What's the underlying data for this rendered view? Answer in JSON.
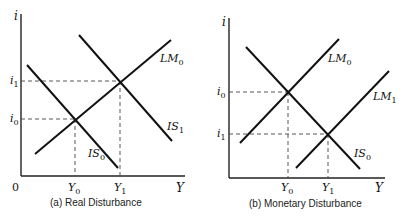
{
  "figure": {
    "panels": [
      {
        "id": "a",
        "caption": "(a) Real Disturbance",
        "y_axis_label": "i",
        "x_axis_label": "Y",
        "origin_label": "0",
        "curves": [
          {
            "name": "LM0",
            "label_main": "LM",
            "label_sub": "0"
          },
          {
            "name": "IS0",
            "label_main": "IS",
            "label_sub": "0"
          },
          {
            "name": "IS1",
            "label_main": "IS",
            "label_sub": "1"
          }
        ],
        "y_ticks": [
          {
            "main": "i",
            "sub": "1"
          },
          {
            "main": "i",
            "sub": "0"
          }
        ],
        "x_ticks": [
          {
            "main": "Y",
            "sub": "0"
          },
          {
            "main": "Y",
            "sub": "1"
          }
        ]
      },
      {
        "id": "b",
        "caption": "(b) Monetary Disturbance",
        "y_axis_label": "i",
        "x_axis_label": "Y",
        "curves": [
          {
            "name": "LM0",
            "label_main": "LM",
            "label_sub": "0"
          },
          {
            "name": "LM1",
            "label_main": "LM",
            "label_sub": "1"
          },
          {
            "name": "IS0",
            "label_main": "IS",
            "label_sub": "0"
          }
        ],
        "y_ticks": [
          {
            "main": "i",
            "sub": "0"
          },
          {
            "main": "i",
            "sub": "1"
          }
        ],
        "x_ticks": [
          {
            "main": "Y",
            "sub": "0"
          },
          {
            "main": "Y",
            "sub": "1"
          }
        ]
      }
    ]
  }
}
